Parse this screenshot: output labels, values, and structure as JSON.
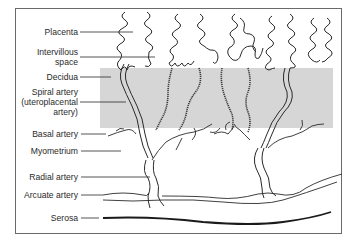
{
  "diagram": {
    "type": "anatomical-illustration",
    "colors": {
      "decidua_fill": "#d6d6d6",
      "line": "#2a2a2a",
      "frame": "#6a6a6a",
      "background": "#ffffff"
    },
    "labels": [
      {
        "id": "placenta",
        "lines": [
          "Placenta"
        ]
      },
      {
        "id": "intervillous",
        "lines": [
          "Intervillous",
          "space"
        ]
      },
      {
        "id": "decidua",
        "lines": [
          "Decidua"
        ]
      },
      {
        "id": "spiral",
        "lines": [
          "Spiral artery",
          "(uteroplacental",
          "artery)"
        ]
      },
      {
        "id": "basal",
        "lines": [
          "Basal artery"
        ]
      },
      {
        "id": "myometrium",
        "lines": [
          "Myometrium"
        ]
      },
      {
        "id": "radial",
        "lines": [
          "Radial artery"
        ]
      },
      {
        "id": "arcuate",
        "lines": [
          "Arcuate artery"
        ]
      },
      {
        "id": "serosa",
        "lines": [
          "Serosa"
        ]
      }
    ]
  }
}
